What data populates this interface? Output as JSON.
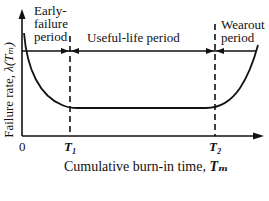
{
  "diagram": {
    "y_axis_label": "Failure rate, λ(Tₘ)",
    "y_axis_label_text": "Failure rate, ",
    "y_axis_label_symbol": "λ(Tₘ)",
    "x_axis_label_text": "Cumulative burn-in time,",
    "x_axis_label_symbol": "Tₘ",
    "origin_label": "0",
    "tick_t1": "T₁",
    "tick_t2": "T₂",
    "regions": [
      {
        "line1": "Early-",
        "line2": "failure",
        "line3": "period"
      },
      {
        "label": "Useful-life period"
      },
      {
        "line1": "Wearout",
        "line2": "period"
      }
    ],
    "colors": {
      "line": "#111111",
      "background": "#ffffff"
    }
  }
}
